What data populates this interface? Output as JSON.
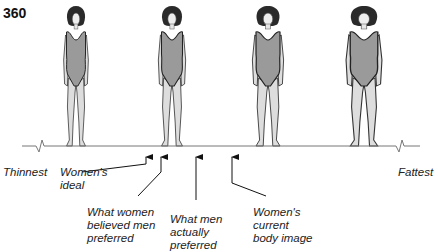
{
  "page_number": "360",
  "scale": {
    "left_label": "Thinnest",
    "right_label": "Fattest"
  },
  "figures": [
    {
      "name": "figure-1-thinnest",
      "center_x": 76
    },
    {
      "name": "figure-2",
      "center_x": 172
    },
    {
      "name": "figure-3",
      "center_x": 268
    },
    {
      "name": "figure-4-fattest",
      "center_x": 364
    }
  ],
  "markers": [
    {
      "id": "womens-ideal",
      "label": "Women's\nideal",
      "arrow_x": 146
    },
    {
      "id": "believed-men-preferred",
      "label": "What women\nbelieved men\npreferred",
      "arrow_x": 161
    },
    {
      "id": "men-actually-preferred",
      "label": "What men\nactually\npreferred",
      "arrow_x": 196
    },
    {
      "id": "current-body-image",
      "label": "Women's\ncurrent\nbody image",
      "arrow_x": 232
    }
  ]
}
